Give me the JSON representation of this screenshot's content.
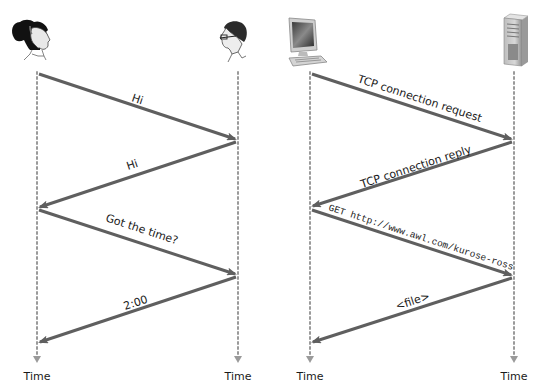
{
  "figure": {
    "left_panel": {
      "participants": [
        {
          "name": "woman",
          "icon": "woman-head-icon",
          "x": 37
        },
        {
          "name": "man",
          "icon": "man-head-icon",
          "x": 238
        }
      ],
      "messages": [
        {
          "label": "Hi",
          "from": "woman",
          "to": "man"
        },
        {
          "label": "Hi",
          "from": "man",
          "to": "woman"
        },
        {
          "label": "Got the time?",
          "from": "woman",
          "to": "man"
        },
        {
          "label": "2:00",
          "from": "man",
          "to": "woman"
        }
      ],
      "time_labels": [
        "Time",
        "Time"
      ]
    },
    "right_panel": {
      "participants": [
        {
          "name": "client",
          "icon": "desktop-computer-icon",
          "x": 310
        },
        {
          "name": "server",
          "icon": "server-tower-icon",
          "x": 514
        }
      ],
      "messages": [
        {
          "label": "TCP connection request",
          "from": "client",
          "to": "server"
        },
        {
          "label": "TCP connection reply",
          "from": "server",
          "to": "client"
        },
        {
          "label": "GET http://www.awl.com/kurose-ross",
          "from": "client",
          "to": "server"
        },
        {
          "label": "<file>",
          "from": "server",
          "to": "client"
        }
      ],
      "time_labels": [
        "Time",
        "Time"
      ]
    },
    "colors": {
      "arrow": "#5f5f5f",
      "lifeline": "#9a9a9a",
      "text": "#1a1a1a"
    }
  }
}
